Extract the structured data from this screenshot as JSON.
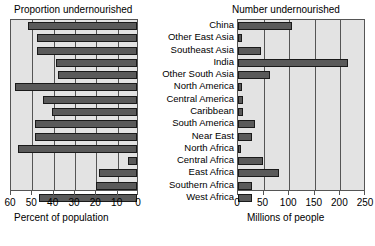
{
  "chart_data": {
    "type": "bar",
    "layout": "paired-horizontal-bars",
    "categories": [
      "China",
      "Other East Asia",
      "Southeast Asia",
      "India",
      "Other South Asia",
      "North America",
      "Central America",
      "Caribbean",
      "South America",
      "Near East",
      "North Africa",
      "Central Africa",
      "East Africa",
      "Southern Africa",
      "West Africa"
    ],
    "panels": [
      {
        "id": "proportion",
        "title": "Proportion undernourished",
        "xlabel": "Percent of population",
        "ylabel": "",
        "xlim": [
          60,
          0
        ],
        "reversed": true,
        "ticks": [
          60,
          50,
          40,
          30,
          20,
          10,
          0
        ],
        "tick_labels": [
          "60",
          "50",
          "40",
          "30",
          "20",
          "10",
          "0"
        ],
        "grid": true,
        "values": [
          9,
          13,
          13,
          22,
          23,
          3,
          16,
          20,
          12,
          12,
          4,
          56,
          42,
          41,
          14
        ]
      },
      {
        "id": "number",
        "title": "Number undernourished",
        "xlabel": "Millions of people",
        "ylabel": "",
        "xlim": [
          0,
          250
        ],
        "reversed": false,
        "ticks": [
          0,
          50,
          100,
          150,
          200,
          250
        ],
        "tick_labels": [
          "0",
          "50",
          "100",
          "150",
          "200",
          "250"
        ],
        "grid": true,
        "values": [
          105,
          8,
          45,
          215,
          62,
          8,
          10,
          9,
          33,
          28,
          5,
          48,
          80,
          28,
          27
        ]
      }
    ],
    "colors": {
      "plot_background": "#e3e3e3",
      "bar_fill": "#5a5a5a",
      "bar_stroke": "#1a1a1a",
      "gridline": "#555555",
      "text": "#000000"
    }
  }
}
